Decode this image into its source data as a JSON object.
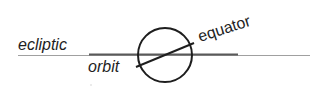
{
  "diagram": {
    "labels": {
      "ecliptic": "ecliptic",
      "orbit": "orbit",
      "equator": "equator"
    },
    "colors": {
      "background": "#ffffff",
      "ink": "#1e1e1e",
      "ecliptic_line": "#9a9a9a",
      "orbit_line": "#5a5a5a"
    },
    "equator_tilt_degrees": 23
  }
}
